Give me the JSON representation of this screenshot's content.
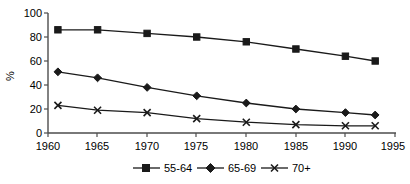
{
  "chart_data": {
    "type": "line",
    "title": "",
    "xlabel": "",
    "ylabel": "%",
    "xlim": [
      1960,
      1995
    ],
    "ylim": [
      0,
      100
    ],
    "xticks": [
      1960,
      1965,
      1970,
      1975,
      1980,
      1985,
      1990,
      1995
    ],
    "yticks": [
      0,
      20,
      40,
      60,
      80,
      100
    ],
    "grid": false,
    "legend_position": "bottom",
    "x": [
      1961,
      1965,
      1970,
      1975,
      1980,
      1985,
      1990,
      1993
    ],
    "series": [
      {
        "name": "55-64",
        "marker": "square",
        "values": [
          86,
          86,
          83,
          80,
          76,
          70,
          64,
          60
        ]
      },
      {
        "name": "65-69",
        "marker": "diamond",
        "values": [
          51,
          46,
          38,
          31,
          25,
          20,
          17,
          15
        ]
      },
      {
        "name": "70+",
        "marker": "x",
        "values": [
          23,
          19,
          17,
          12,
          9,
          7,
          6,
          6
        ]
      }
    ]
  },
  "axis": {
    "y_label": "%",
    "y_tick_labels": [
      "100",
      "80",
      "60",
      "40",
      "20",
      "0"
    ],
    "x_tick_labels": [
      "1960",
      "1965",
      "1970",
      "1975",
      "1980",
      "1985",
      "1990",
      "1995"
    ]
  },
  "legend": {
    "items": [
      {
        "label": "55-64",
        "marker": "square"
      },
      {
        "label": "65-69",
        "marker": "diamond"
      },
      {
        "label": "70+",
        "marker": "x"
      }
    ]
  }
}
